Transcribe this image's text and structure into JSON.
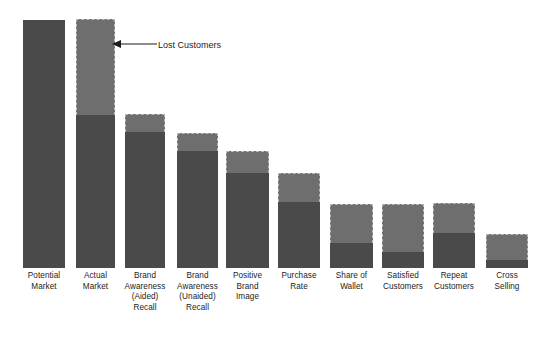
{
  "chart_data": {
    "type": "bar",
    "title": "",
    "subtitle": "",
    "xlabel": "",
    "ylabel": "",
    "grid": false,
    "legend_position": "none",
    "stacked": true,
    "ylim": [
      0,
      100
    ],
    "categories": [
      "Potential\nMarket",
      "Actual\nMarket",
      "Brand\nAwareness\n(Aided)\nRecall",
      "Brand\nAwareness\n(Unaided)\nRecall",
      "Positive\nBrand\nImage",
      "Purchase\nRate",
      "Share of\nWallet",
      "Satisfied\nCustomers",
      "Repeat\nCustomers",
      "Cross\nSelling"
    ],
    "series": [
      {
        "name": "Retained",
        "color": "#4a4a4a",
        "values": [
          100,
          61,
          54,
          46,
          38,
          26,
          10,
          6,
          14,
          3
        ]
      },
      {
        "name": "Lost Customers",
        "color": "#6e6e6e",
        "values": [
          0,
          37,
          7,
          7,
          9,
          11,
          15,
          19,
          12,
          10
        ]
      }
    ],
    "annotations": [
      {
        "text": "Lost Customers",
        "target_category": "Actual Market",
        "target_segment": "Lost Customers"
      }
    ],
    "totals": [
      100,
      98,
      61,
      53,
      47,
      37,
      25,
      25,
      26,
      13
    ]
  },
  "bars": [
    {
      "label": "Potential\nMarket",
      "x": 23,
      "width": 42,
      "top": 20,
      "split": 20,
      "bottom": 268
    },
    {
      "label": "Actual\nMarket",
      "x": 76,
      "width": 39,
      "top": 19,
      "split": 115,
      "bottom": 268
    },
    {
      "label": "Brand\nAwareness\n(Aided)\nRecall",
      "x": 125,
      "width": 40,
      "top": 114,
      "split": 132,
      "bottom": 268
    },
    {
      "label": "Brand\nAwareness\n(Unaided)\nRecall",
      "x": 177,
      "width": 41,
      "top": 133,
      "split": 151,
      "bottom": 268
    },
    {
      "label": "Positive\nBrand\nImage",
      "x": 226,
      "width": 43,
      "top": 151,
      "split": 173,
      "bottom": 268
    },
    {
      "label": "Purchase\nRate",
      "x": 278,
      "width": 42,
      "top": 173,
      "split": 202,
      "bottom": 268
    },
    {
      "label": "Share of\nWallet",
      "x": 330,
      "width": 43,
      "top": 204,
      "split": 243,
      "bottom": 268
    },
    {
      "label": "Satisfied\nCustomers",
      "x": 382,
      "width": 42,
      "top": 204,
      "split": 252,
      "bottom": 268
    },
    {
      "label": "Repeat\nCustomers",
      "x": 433,
      "width": 42,
      "top": 203,
      "split": 233,
      "bottom": 268
    },
    {
      "label": "Cross\nSelling",
      "x": 486,
      "width": 42,
      "top": 234,
      "split": 260,
      "bottom": 268
    }
  ],
  "annotation": {
    "text": "Lost Customers",
    "text_x": 158,
    "text_y": 40
  },
  "colors": {
    "retained": "#4a4a4a",
    "lost": "#6e6e6e",
    "lost_border": "#b9b9b9",
    "label_text": "#1c1c1c",
    "background": "#ffffff"
  }
}
